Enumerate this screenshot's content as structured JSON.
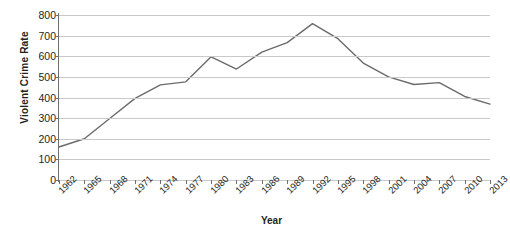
{
  "chart_data": {
    "type": "line",
    "title": "",
    "xlabel": "Year",
    "ylabel": "Violent Crime Rate",
    "ylim": [
      0,
      800
    ],
    "xlim": [
      1962,
      2013
    ],
    "ytick_step": 100,
    "xtick_step": 3,
    "grid": "horizontal",
    "legend": "none",
    "line_color": "#6b6b6b",
    "gridline_color": "#c9c9c9",
    "axis_color": "#6f6f6f",
    "yticks": [
      "0",
      "100",
      "200",
      "300",
      "400",
      "500",
      "600",
      "700",
      "800"
    ],
    "xticks": [
      "1962",
      "1965",
      "1968",
      "1971",
      "1974",
      "1977",
      "1980",
      "1983",
      "1986",
      "1989",
      "1992",
      "1995",
      "1998",
      "2001",
      "2004",
      "2007",
      "2010",
      "2013"
    ],
    "series": [
      {
        "name": "Violent Crime Rate",
        "x": [
          1962,
          1965,
          1968,
          1971,
          1974,
          1977,
          1980,
          1983,
          1986,
          1989,
          1992,
          1995,
          1998,
          2001,
          2004,
          2007,
          2010,
          2013
        ],
        "values": [
          160,
          200,
          298,
          396,
          461,
          476,
          597,
          538,
          620,
          666,
          758,
          685,
          567,
          500,
          463,
          472,
          405,
          368
        ]
      }
    ]
  }
}
